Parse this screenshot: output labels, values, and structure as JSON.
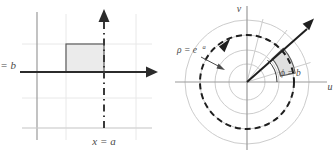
{
  "figure": {
    "panels": [
      {
        "id": "cartesian-panel",
        "axis_labels": {
          "horizontal": "",
          "vertical": ""
        },
        "labels": [
          {
            "name": "y-equals-b-label",
            "text": "y = b"
          },
          {
            "name": "x-equals-a-label",
            "text": "x = a"
          }
        ],
        "region": {
          "name": "shaded-rectangle",
          "fill": "#ebebeb",
          "stroke": "#555555"
        },
        "grid": {
          "visible": true,
          "color": "#e3e3e3"
        },
        "axes": {
          "color": "#8c8c8c",
          "arrow_color": "#2b2b2b"
        },
        "dashed_line": {
          "name": "x-equals-a-dashed-line",
          "color": "#3a3a3a"
        }
      },
      {
        "id": "polar-panel",
        "axis_labels": {
          "horizontal": "u",
          "vertical": "v"
        },
        "labels": [
          {
            "name": "rho-equals-exp-a-label",
            "text": "ρ = e"
          },
          {
            "name": "rho-equals-exp-a-exponent",
            "text": "a"
          },
          {
            "name": "phi-equals-b-label",
            "text": "ϕ = b"
          }
        ],
        "region": {
          "name": "shaded-sector",
          "fill": "#e0e0e0",
          "stroke": "#555555"
        },
        "circles": {
          "visible": true,
          "color": "#c9c9c9"
        },
        "dashed_circle": {
          "name": "rho-equals-exp-a-circle",
          "color": "#2b2b2b"
        },
        "rays": {
          "color": "#c9c9c9"
        },
        "bold_ray": {
          "name": "phi-equals-b-ray",
          "color": "#1f1f1f"
        },
        "axes": {
          "color": "#9a9a9a"
        }
      }
    ],
    "colors": {
      "background": "#ffffff",
      "grid": "#e3e3e3",
      "axis": "#8c8c8c",
      "accent_dark": "#1f1f1f",
      "shade": "#ebebeb"
    }
  }
}
